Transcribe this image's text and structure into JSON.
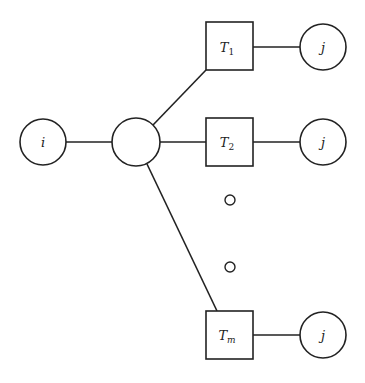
{
  "diagram": {
    "stroke_color": "#222222",
    "background": "#ffffff",
    "nodes": {
      "source": {
        "label": "i",
        "shape": "circle"
      },
      "hub": {
        "label": "",
        "shape": "circle"
      },
      "t1": {
        "label": "T",
        "sub": "1",
        "shape": "square"
      },
      "t2": {
        "label": "T",
        "sub": "2",
        "shape": "square"
      },
      "tm": {
        "label": "T",
        "sub": "m",
        "shape": "square"
      },
      "j1": {
        "label": "j",
        "shape": "circle"
      },
      "j2": {
        "label": "j",
        "shape": "circle"
      },
      "jm": {
        "label": "j",
        "shape": "circle"
      }
    },
    "ellipsis": [
      "dot",
      "dot"
    ],
    "edges": [
      [
        "source",
        "hub"
      ],
      [
        "hub",
        "t1"
      ],
      [
        "hub",
        "t2"
      ],
      [
        "hub",
        "tm"
      ],
      [
        "t1",
        "j1"
      ],
      [
        "t2",
        "j2"
      ],
      [
        "tm",
        "jm"
      ]
    ]
  }
}
